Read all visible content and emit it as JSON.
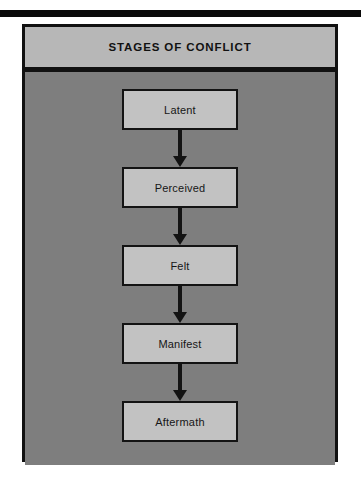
{
  "figure": {
    "title": "STAGES OF CONFLICT",
    "colors": {
      "title_band": "#b7b7b7",
      "body_background": "#7e7e7e",
      "box_fill": "#c2c2c2",
      "outline": "#111111",
      "text": "#161616"
    },
    "stages": [
      {
        "label": "Latent"
      },
      {
        "label": "Perceived"
      },
      {
        "label": "Felt"
      },
      {
        "label": "Manifest"
      },
      {
        "label": "Aftermath"
      }
    ],
    "connector_icon": "arrow-down-icon"
  },
  "chart_data": {
    "type": "diagram",
    "diagram_type": "flowchart-vertical",
    "title": "STAGES OF CONFLICT",
    "nodes": [
      "Latent",
      "Perceived",
      "Felt",
      "Manifest",
      "Aftermath"
    ],
    "edges": [
      {
        "from": "Latent",
        "to": "Perceived",
        "style": "solid-arrow-down"
      },
      {
        "from": "Perceived",
        "to": "Felt",
        "style": "solid-arrow-down"
      },
      {
        "from": "Felt",
        "to": "Manifest",
        "style": "solid-arrow-down"
      },
      {
        "from": "Manifest",
        "to": "Aftermath",
        "style": "solid-arrow-down"
      }
    ],
    "direction": "top-to-bottom",
    "legend": [],
    "annotations": []
  }
}
